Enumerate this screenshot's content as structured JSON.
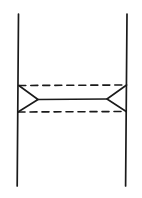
{
  "figure": {
    "type": "line-diagram",
    "width": 142,
    "height": 198,
    "background_color": "#ffffff",
    "ink_color": "#1a1a1a",
    "caption": "",
    "labels": [],
    "elements": {
      "left_fermion_line": {
        "name": "left vertical line",
        "style": "solid",
        "stroke_width": 1.7,
        "x1": 18.5,
        "y1": 14,
        "x2": 17.2,
        "y2": 186
      },
      "right_fermion_line": {
        "name": "right vertical line",
        "style": "solid",
        "stroke_width": 1.7,
        "x1": 127.0,
        "y1": 14,
        "x2": 125.6,
        "y2": 186
      },
      "exchange_line": {
        "name": "central horizontal line",
        "style": "solid",
        "stroke_width": 1.6,
        "x1": 38.0,
        "y1": 99.5,
        "x2": 107.0,
        "y2": 99.0
      },
      "upper_dashed_line": {
        "name": "upper dashed line",
        "style": "dashed",
        "stroke_width": 1.6,
        "dash": "7 5",
        "x1": 18.8,
        "y1": 85.5,
        "x2": 126.6,
        "y2": 85.0
      },
      "lower_dashed_line": {
        "name": "lower dashed line",
        "style": "dashed",
        "stroke_width": 1.6,
        "dash": "7 5",
        "x1": 18.0,
        "y1": 112.0,
        "x2": 126.2,
        "y2": 111.5
      },
      "left_vertex": {
        "name": "left triangular vertex",
        "style": "solid",
        "stroke_width": 1.6,
        "apex_x": 38.0,
        "apex_y": 99.5,
        "base_top_x": 18.8,
        "base_top_y": 85.5,
        "base_bottom_x": 18.0,
        "base_bottom_y": 112.0
      },
      "right_vertex": {
        "name": "right triangular vertex",
        "style": "solid",
        "stroke_width": 1.6,
        "apex_x": 107.0,
        "apex_y": 99.0,
        "base_top_x": 126.6,
        "base_top_y": 85.0,
        "base_bottom_x": 126.2,
        "base_bottom_y": 111.5
      }
    }
  }
}
